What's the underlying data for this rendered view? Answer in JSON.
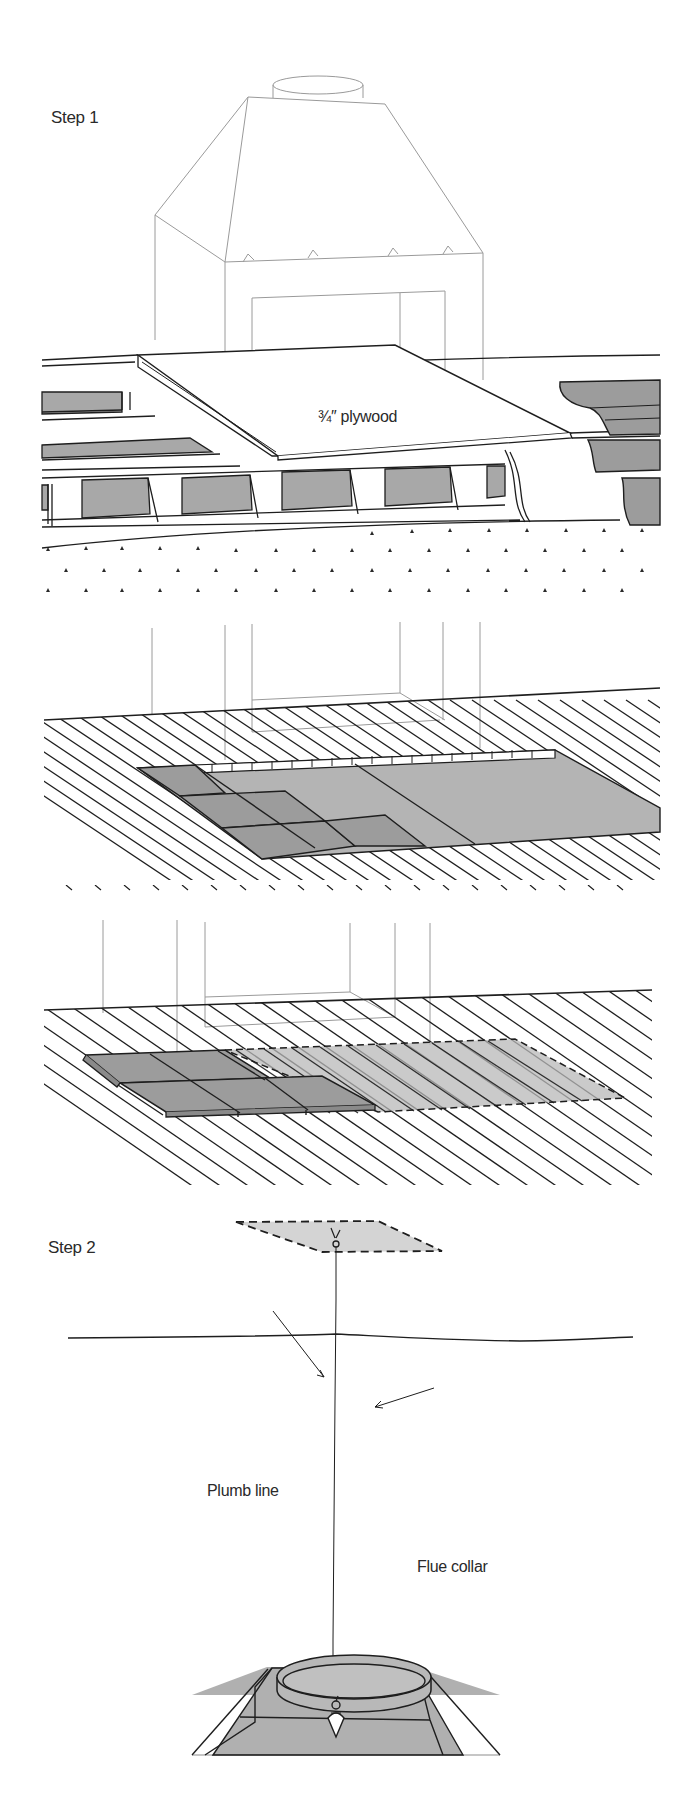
{
  "figure": {
    "colors": {
      "ink": "#1e1e1e",
      "faint_ink": "#9a9a9a",
      "fill_light": "#c8c8c8",
      "fill_mid": "#acacac",
      "fill_dark": "#9a9a9a",
      "background": "#ffffff"
    },
    "panels": [
      {
        "id": "step1-plywood",
        "step_label": "Step 1",
        "callouts": [
          {
            "text": "¾″ plywood"
          }
        ]
      },
      {
        "id": "step1-tiles-over-plywood",
        "callouts": []
      },
      {
        "id": "step1-tiles-over-floor",
        "callouts": []
      },
      {
        "id": "step2-plumb",
        "step_label": "Step 2",
        "callouts": [
          {
            "text": "Plumb line"
          },
          {
            "text": "Flue collar"
          }
        ]
      }
    ]
  }
}
